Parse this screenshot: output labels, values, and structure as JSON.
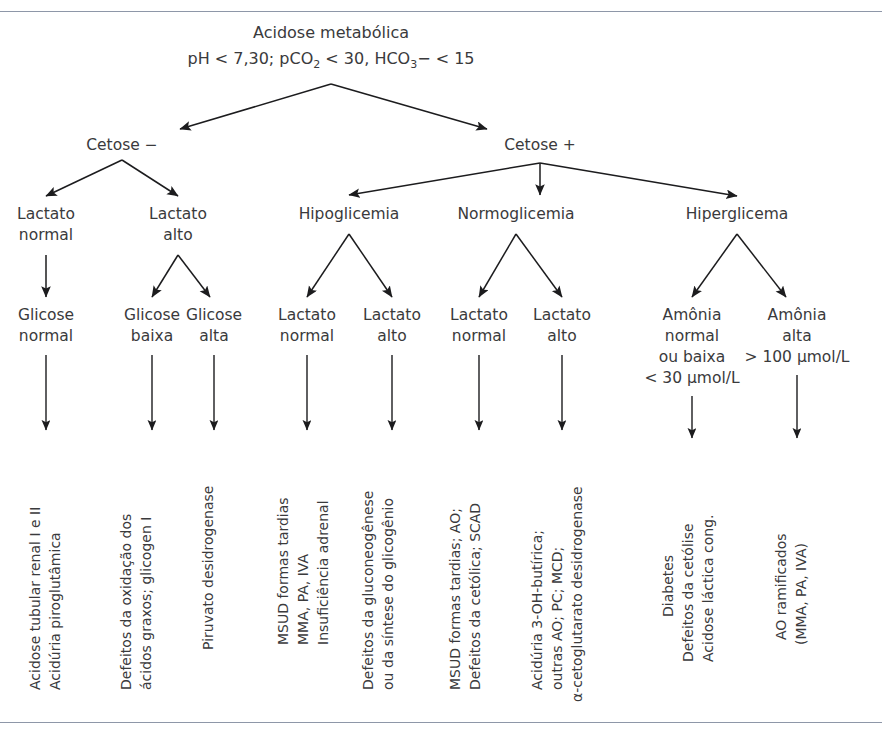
{
  "figure": {
    "kind": "clinical-decision-flowchart",
    "language": "pt-BR",
    "line_color": "#1c1c1e",
    "text_color": "#3a3a3c",
    "rule_color": "#8e97a8",
    "background": "#ffffff"
  },
  "root": {
    "line1": "Acidose metabólica",
    "line2_pre": "pH < 7,30; pCO",
    "line2_sub1": "2",
    "line2_mid": " < 30, HCO",
    "line2_sub2": "3",
    "line2_post": "− < 15"
  },
  "level2": {
    "cetose_neg": "Cetose −",
    "cetose_pos": "Cetose +"
  },
  "level3": {
    "lactato_normal_l1": "Lactato",
    "lactato_normal_l2": "normal",
    "lactato_alto_l1": "Lactato",
    "lactato_alto_l2": "alto",
    "hipoglicemia": "Hipoglicemia",
    "normoglicemia": "Normoglicemia",
    "hiperglicema": "Hiperglicema"
  },
  "level4": {
    "glicose_normal_l1": "Glicose",
    "glicose_normal_l2": "normal",
    "glicose_baixa_l1": "Glicose",
    "glicose_baixa_l2": "baixa",
    "glicose_alta_l1": "Glicose",
    "glicose_alta_l2": "alta",
    "hipo_lactato_normal_l1": "Lactato",
    "hipo_lactato_normal_l2": "normal",
    "hipo_lactato_alto_l1": "Lactato",
    "hipo_lactato_alto_l2": "alto",
    "normo_lactato_normal_l1": "Lactato",
    "normo_lactato_normal_l2": "normal",
    "normo_lactato_alto_l1": "Lactato",
    "normo_lactato_alto_l2": "alto",
    "amonia_normal_l1": "Amônia",
    "amonia_normal_l2": "normal",
    "amonia_normal_l3": "ou baixa",
    "amonia_normal_l4": "< 30 µmol/L",
    "amonia_alta_l1": "Amônia",
    "amonia_alta_l2": "alta",
    "amonia_alta_l3": "> 100 µmol/L"
  },
  "outcomes": {
    "glicose_normal": [
      "Acidose tubular renal I e II",
      "Acidúria piroglutâmica"
    ],
    "glicose_baixa": [
      "Defeitos da oxidação dos",
      "ácidos graxos; glicogen I"
    ],
    "glicose_alta": [
      "Piruvato desidrogenase"
    ],
    "hipo_lactato_normal": [
      "MSUD formas tardias",
      "MMA, PA, IVA",
      "Insuficiência adrenal"
    ],
    "hipo_lactato_alto": [
      "Defeitos da gluconeogênese",
      "ou da síntese do glicogênio"
    ],
    "normo_lactato_normal": [
      "MSUD formas tardias; AO;",
      "Defeitos da cetólica; SCAD"
    ],
    "normo_lactato_alto": [
      "Acidúria 3-OH-butírica;",
      "outras AO; PC; MCD;",
      "α-cetoglutarato desidrogenase"
    ],
    "amonia_normal": [
      "Diabetes",
      "Defeitos da cetólise",
      "Acidose láctica cong."
    ],
    "amonia_alta": [
      "AO ramificados",
      "(MMA, PA, IVA)"
    ]
  }
}
